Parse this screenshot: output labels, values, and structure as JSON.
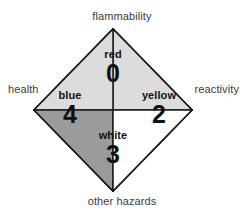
{
  "diagram": {
    "axis_labels": {
      "top": "flammability",
      "left": "health",
      "right": "reactivity",
      "bottom": "other hazards"
    },
    "quadrants": [
      {
        "position": "top",
        "name": "flammability",
        "color_name": "red",
        "value": "0",
        "fill": "#dcdcdc",
        "stroke": "#1a1a1a"
      },
      {
        "position": "left",
        "name": "health",
        "color_name": "blue",
        "value": "4",
        "fill": "#9b9b9b",
        "stroke": "#1a1a1a"
      },
      {
        "position": "right",
        "name": "reactivity",
        "color_name": "yellow",
        "value": "2",
        "fill": "#ffffff",
        "stroke": "#1a1a1a"
      },
      {
        "position": "bottom",
        "name": "other hazards",
        "color_name": "white",
        "value": "3",
        "fill": "#ffffff",
        "stroke": "#1a1a1a"
      }
    ]
  }
}
